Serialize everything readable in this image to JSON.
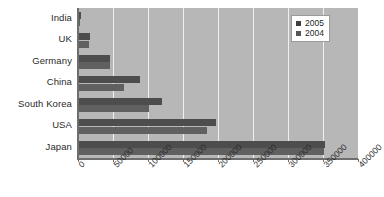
{
  "chart_data": {
    "type": "bar",
    "orientation": "horizontal",
    "title": "",
    "subtitle": "",
    "xlabel": "",
    "ylabel": "",
    "categories": [
      "India",
      "UK",
      "Germany",
      "China",
      "South Korea",
      "USA",
      "Japan"
    ],
    "series": [
      {
        "name": "2005",
        "color": "#4d4d4d",
        "values": [
          4000,
          17000,
          45000,
          89000,
          120000,
          197000,
          353000
        ]
      },
      {
        "name": "2004",
        "color": "#606060",
        "values": [
          3000,
          16000,
          45000,
          66000,
          102000,
          184000,
          352000
        ]
      }
    ],
    "xlim": [
      0,
      400000
    ],
    "xticks": [
      0,
      50000,
      100000,
      150000,
      200000,
      250000,
      300000,
      350000,
      400000
    ],
    "xtick_labels": [
      "0",
      "50000",
      "100000",
      "150000",
      "200000",
      "250000",
      "300000",
      "350000",
      "400000"
    ],
    "grid": true,
    "grid_axis": "x",
    "legend_position": "top-right",
    "plot_background": "#b7b7b7",
    "gridline_color": "#f0f0f0",
    "axis_color": "#6e6e6e"
  },
  "legend": {
    "entries": [
      {
        "label": "2005",
        "swatch": "legend-swatch-2005"
      },
      {
        "label": "2004",
        "swatch": "legend-swatch-2004"
      }
    ]
  }
}
